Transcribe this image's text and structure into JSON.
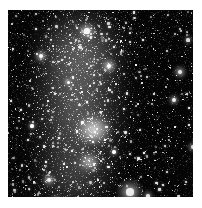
{
  "image": {
    "kind": "astronomical-photograph",
    "subject": "dense star field with diffuse nebular band and bright central cluster knots",
    "alt_text": "Grayscale telescope image of a crowded star field; a diffuse luminous band runs vertically through the left of centre, with a bright irregular nebular knot at the centre and a smaller knot below it. Several bright foreground stars are scattered across the frame, the brightest in the lower centre-right.",
    "frame": {
      "x": 8,
      "y": 10,
      "width": 185,
      "height": 187,
      "margin_color": "#ffffff",
      "sky_color": "#050505",
      "star_color": "#ffffff",
      "nebula_color": "#f2f2f2"
    },
    "structures": [
      {
        "name": "central-nebular-knot",
        "cx": 86,
        "cy": 120,
        "rx": 17,
        "ry": 15,
        "brightness": 1.0
      },
      {
        "name": "lower-nebular-knot",
        "cx": 81,
        "cy": 152,
        "rx": 10,
        "ry": 9,
        "brightness": 0.92
      },
      {
        "name": "diffuse-band",
        "cx": 70,
        "cy": 95,
        "rx": 46,
        "ry": 96,
        "brightness": 0.42
      },
      {
        "name": "upper-halo",
        "cx": 74,
        "cy": 40,
        "rx": 44,
        "ry": 42,
        "brightness": 0.3
      },
      {
        "name": "lower-halo",
        "cx": 64,
        "cy": 170,
        "rx": 42,
        "ry": 36,
        "brightness": 0.2
      }
    ],
    "bright_stars": [
      {
        "name": "star-top-centre",
        "cx": 79,
        "cy": 21,
        "r": 2.6,
        "halo": 9,
        "brightness": 1.0
      },
      {
        "name": "star-upper-right",
        "cx": 101,
        "cy": 56,
        "r": 2.4,
        "halo": 8,
        "brightness": 0.95
      },
      {
        "name": "star-right-upper",
        "cx": 172,
        "cy": 62,
        "r": 2.2,
        "halo": 7,
        "brightness": 0.9
      },
      {
        "name": "star-right-mid",
        "cx": 166,
        "cy": 90,
        "r": 1.9,
        "halo": 6,
        "brightness": 0.82
      },
      {
        "name": "star-right-lower",
        "cx": 185,
        "cy": 137,
        "r": 1.9,
        "halo": 6,
        "brightness": 0.8
      },
      {
        "name": "star-left-upper",
        "cx": 33,
        "cy": 46,
        "r": 2.0,
        "halo": 7,
        "brightness": 0.85
      },
      {
        "name": "star-lower-centre-right",
        "cx": 122,
        "cy": 182,
        "r": 3.6,
        "halo": 13,
        "brightness": 1.0
      },
      {
        "name": "star-lower-left",
        "cx": 41,
        "cy": 170,
        "r": 2.0,
        "halo": 7,
        "brightness": 0.85
      },
      {
        "name": "star-bottom-left",
        "cx": 48,
        "cy": 192,
        "r": 2.2,
        "halo": 8,
        "brightness": 0.88
      },
      {
        "name": "star-right-edge-low",
        "cx": 140,
        "cy": 186,
        "r": 1.8,
        "halo": 6,
        "brightness": 0.8
      },
      {
        "name": "star-centre-low",
        "cx": 106,
        "cy": 142,
        "r": 1.7,
        "halo": 5,
        "brightness": 0.75
      },
      {
        "name": "star-mid-left",
        "cx": 24,
        "cy": 116,
        "r": 1.6,
        "halo": 5,
        "brightness": 0.72
      },
      {
        "name": "star-far-right-top",
        "cx": 180,
        "cy": 30,
        "r": 1.6,
        "halo": 5,
        "brightness": 0.7
      },
      {
        "name": "star-centre-high",
        "cx": 60,
        "cy": 72,
        "r": 1.5,
        "halo": 5,
        "brightness": 0.68
      }
    ],
    "field_stars": {
      "count": 2100,
      "min_radius": 0.35,
      "max_radius": 1.25
    },
    "grain": {
      "count": 5200,
      "opacity": 0.55
    }
  }
}
